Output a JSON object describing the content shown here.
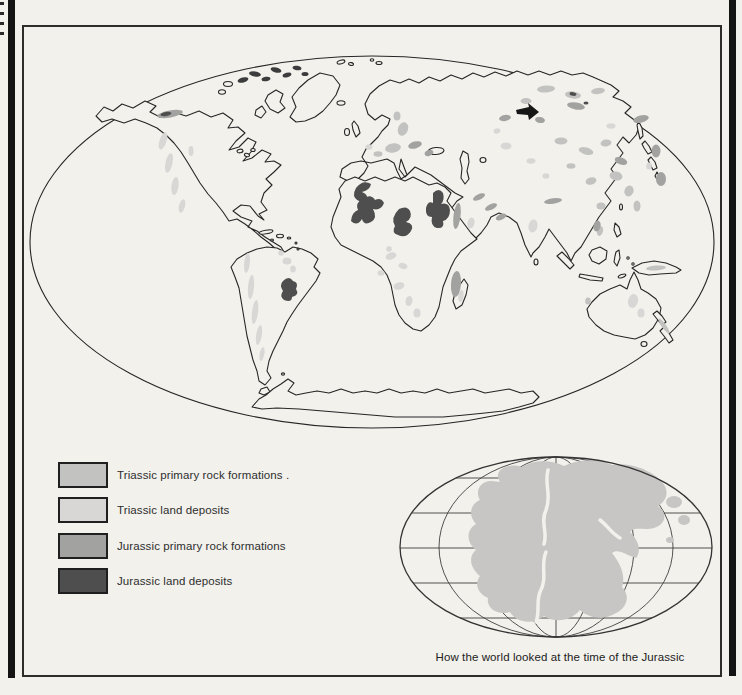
{
  "legend": {
    "items": [
      {
        "key": "triassic-primary",
        "label": "Triassic primary rock formations ."
      },
      {
        "key": "triassic-land",
        "label": "Triassic land deposits"
      },
      {
        "key": "jurassic-primary",
        "label": "Jurassic primary rock formations"
      },
      {
        "key": "jurassic-land",
        "label": "Jurassic land deposits"
      }
    ]
  },
  "inset": {
    "caption": "How the world looked at the time of the Jurassic"
  },
  "palette": {
    "c_tp": "#c2c2c1",
    "c_tl": "#d8d7d5",
    "c_jp": "#a2a2a1",
    "c_jl": "#4e4e4e",
    "ink": "#262626",
    "paper": "#f2f1ec",
    "pangaea": "#c7c6c4",
    "spine": "#141414",
    "isl_dark": "#3c3c3c"
  }
}
